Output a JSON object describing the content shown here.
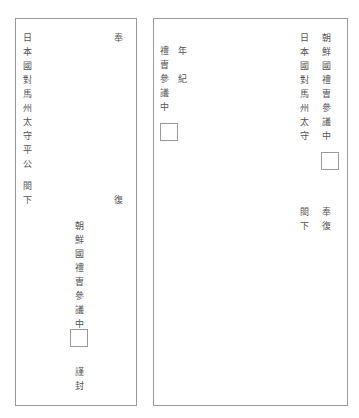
{
  "left_sheet": {
    "address_column": [
      "日",
      "本",
      "國",
      "對",
      "馬",
      "州",
      "太",
      "守",
      "平",
      "公"
    ],
    "honorific_column": [
      "閤",
      "下"
    ],
    "top_right": "奉",
    "mid_right": "復",
    "sender_column": [
      "朝",
      "鮮",
      "國",
      "禮",
      "曺",
      "參",
      "議",
      "中"
    ],
    "closing_column": [
      "謹",
      "封"
    ]
  },
  "right_sheet": {
    "recipient_column": [
      "朝",
      "鮮",
      "國",
      "禮",
      "曺",
      "參",
      "議",
      "中"
    ],
    "sender_address_column": [
      "日",
      "本",
      "國",
      "對",
      "馬",
      "州",
      "太",
      "守"
    ],
    "honorific_column": [
      "閤",
      "下"
    ],
    "reply_column": [
      "奉",
      "復"
    ],
    "date_column_chars": [
      "年",
      "紀"
    ],
    "office_column": [
      "禮",
      "曺",
      "參",
      "議",
      "中"
    ]
  }
}
